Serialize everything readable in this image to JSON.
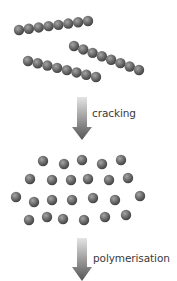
{
  "colors": {
    "sphere": "#6a6a6a",
    "sphere_highlight": "#9a9a9a",
    "sphere_shadow": "#3f3f3f",
    "arrow_top": "#d8d8d8",
    "arrow_bottom": "#5a5a5a",
    "text": "#3a3a3a",
    "background": "#ffffff"
  },
  "sphere_radius": 5.2,
  "long_chains": [
    {
      "start": [
        19,
        30
      ],
      "end": [
        88,
        21
      ],
      "count": 8
    },
    {
      "start": [
        74,
        46
      ],
      "end": [
        139,
        70
      ],
      "count": 8
    },
    {
      "start": [
        28,
        61
      ],
      "end": [
        96,
        77
      ],
      "count": 8
    }
  ],
  "small_molecules": [
    [
      43,
      161
    ],
    [
      64,
      164
    ],
    [
      82,
      160
    ],
    [
      102,
      164
    ],
    [
      121,
      160
    ],
    [
      30,
      179
    ],
    [
      52,
      180
    ],
    [
      71,
      180
    ],
    [
      88,
      179
    ],
    [
      109,
      180
    ],
    [
      128,
      178
    ],
    [
      16,
      197
    ],
    [
      34,
      202
    ],
    [
      52,
      200
    ],
    [
      72,
      200
    ],
    [
      93,
      198
    ],
    [
      115,
      200
    ],
    [
      140,
      196
    ],
    [
      29,
      220
    ],
    [
      47,
      217
    ],
    [
      63,
      219
    ],
    [
      84,
      220
    ],
    [
      105,
      217
    ],
    [
      126,
      215
    ]
  ],
  "steps": [
    {
      "label": "cracking",
      "arrow": {
        "x": 82,
        "top": 97,
        "head_start": 127,
        "bottom": 140
      },
      "label_pos": [
        92,
        107
      ]
    },
    {
      "label": "polymerisation",
      "arrow": {
        "x": 82,
        "top": 238,
        "head_start": 267,
        "bottom": 281
      },
      "label_pos": [
        93,
        252
      ]
    }
  ]
}
